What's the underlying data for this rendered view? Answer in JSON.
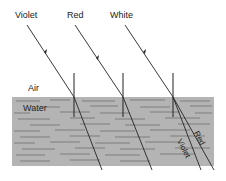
{
  "diagram": {
    "type": "refraction-dispersion",
    "labels": {
      "violet_ray": "Violet",
      "red_ray": "Red",
      "white_ray": "White",
      "air": "Air",
      "water": "Water",
      "dispersed_red": "Red",
      "dispersed_violet": "Violet"
    },
    "colors": {
      "water": "#b4b4b4",
      "ripple": "#6e6e6e",
      "ray": "#222222"
    }
  }
}
